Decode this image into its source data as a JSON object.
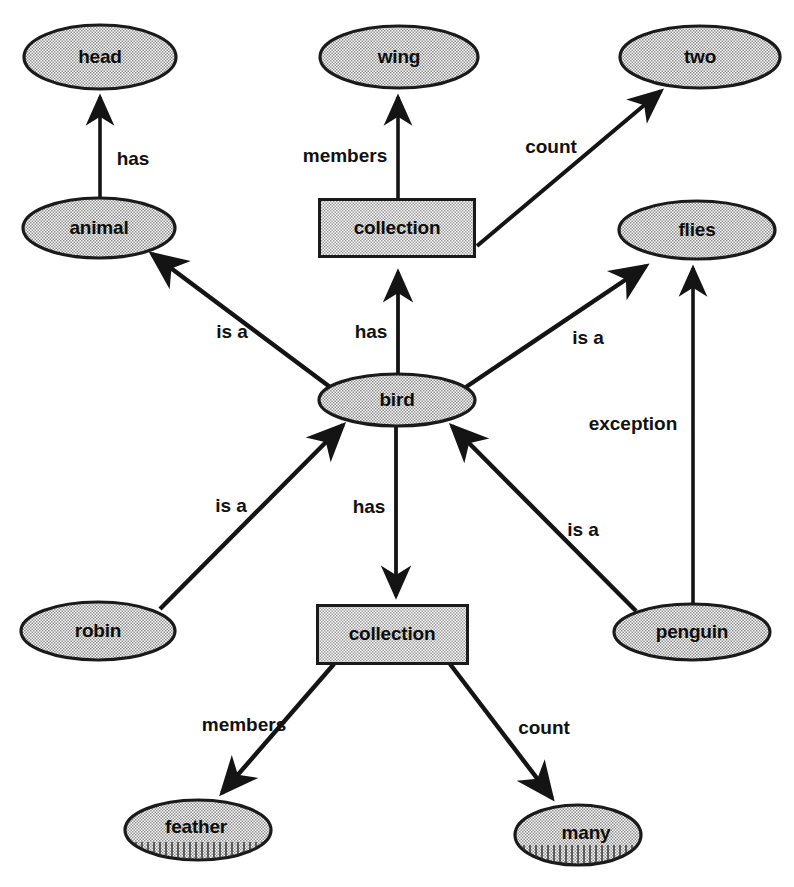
{
  "diagram": {
    "background_color": "#ffffff",
    "stroke_color": "#1a1a1a",
    "node_fill": "#d4d4d4",
    "nodes": [
      {
        "id": "head",
        "label": "head",
        "shape": "ellipse",
        "cx": 100,
        "cy": 57,
        "rx": 76,
        "ry": 32
      },
      {
        "id": "wing",
        "label": "wing",
        "shape": "ellipse",
        "cx": 399,
        "cy": 57,
        "rx": 79,
        "ry": 31
      },
      {
        "id": "two",
        "label": "two",
        "shape": "ellipse",
        "cx": 700,
        "cy": 57,
        "rx": 80,
        "ry": 31
      },
      {
        "id": "animal",
        "label": "animal",
        "shape": "ellipse",
        "cx": 99,
        "cy": 228,
        "rx": 76,
        "ry": 30
      },
      {
        "id": "collection1",
        "label": "collection",
        "shape": "rect",
        "cx": 397,
        "cy": 228,
        "w": 155,
        "h": 57
      },
      {
        "id": "flies",
        "label": "flies",
        "shape": "ellipse",
        "cx": 697,
        "cy": 230,
        "rx": 78,
        "ry": 29
      },
      {
        "id": "bird",
        "label": "bird",
        "shape": "ellipse",
        "cx": 397,
        "cy": 400,
        "rx": 78,
        "ry": 26
      },
      {
        "id": "robin",
        "label": "robin",
        "shape": "ellipse",
        "cx": 98,
        "cy": 631,
        "rx": 77,
        "ry": 29
      },
      {
        "id": "collection2",
        "label": "collection",
        "shape": "rect",
        "cx": 392,
        "cy": 634,
        "w": 150,
        "h": 58
      },
      {
        "id": "penguin",
        "label": "penguin",
        "shape": "ellipse",
        "cx": 692,
        "cy": 632,
        "rx": 78,
        "ry": 28
      },
      {
        "id": "feather",
        "label": "feather",
        "shape": "ellipse",
        "cx": 198,
        "cy": 830,
        "rx": 73,
        "ry": 30
      },
      {
        "id": "many",
        "label": "many",
        "shape": "ellipse",
        "cx": 578,
        "cy": 835,
        "rx": 63,
        "ry": 30
      }
    ],
    "edges": [
      {
        "id": "animal-has-head",
        "from": "animal",
        "to": "head",
        "label": "has",
        "label_x": 133,
        "label_y": 160
      },
      {
        "id": "collection1-members-wing",
        "from": "collection1",
        "to": "wing",
        "label": "members",
        "label_x": 345,
        "label_y": 157
      },
      {
        "id": "collection1-count-two",
        "from": "collection1",
        "to": "two",
        "label": "count",
        "label_x": 551,
        "label_y": 148
      },
      {
        "id": "bird-isa-animal",
        "from": "bird",
        "to": "animal",
        "label": "is a",
        "label_x": 232,
        "label_y": 333
      },
      {
        "id": "bird-has-collection1",
        "from": "bird",
        "to": "collection1",
        "label": "has",
        "label_x": 371,
        "label_y": 333
      },
      {
        "id": "bird-isa-flies",
        "from": "bird",
        "to": "flies",
        "label": "is a",
        "label_x": 588,
        "label_y": 339
      },
      {
        "id": "robin-isa-bird",
        "from": "robin",
        "to": "bird",
        "label": "is a",
        "label_x": 231,
        "label_y": 507
      },
      {
        "id": "bird-has-collection2",
        "from": "bird",
        "to": "collection2",
        "label": "has",
        "label_x": 369,
        "label_y": 508
      },
      {
        "id": "penguin-isa-bird",
        "from": "penguin",
        "to": "bird",
        "label": "is a",
        "label_x": 583,
        "label_y": 531
      },
      {
        "id": "penguin-exception-flies",
        "from": "penguin",
        "to": "flies",
        "label": "exception",
        "label_x": 633,
        "label_y": 425
      },
      {
        "id": "collection2-members-feather",
        "from": "collection2",
        "to": "feather",
        "label": "members",
        "label_x": 244,
        "label_y": 726
      },
      {
        "id": "collection2-count-many",
        "from": "collection2",
        "to": "many",
        "label": "count",
        "label_x": 544,
        "label_y": 729
      }
    ]
  }
}
